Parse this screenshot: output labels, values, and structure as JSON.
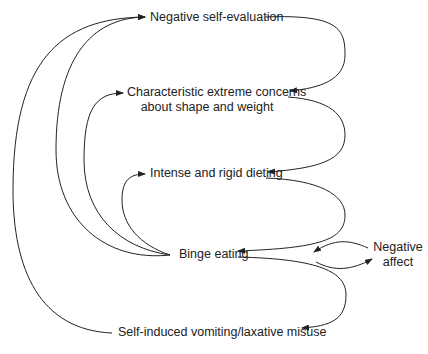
{
  "diagram": {
    "type": "cognitive-behavioural model (flow diagram)",
    "nodes": {
      "negative_self_evaluation": "Negative self-evaluation",
      "concerns_line1": "Characteristic extreme concerns",
      "concerns_line2": "about shape and weight",
      "dieting": "Intense and rigid dieting",
      "binge_eating": "Binge eating",
      "negative_affect_line1": "Negative",
      "negative_affect_line2": "affect",
      "compensatory": "Self-induced vomiting/laxative misuse"
    },
    "edges": [
      {
        "from": "Negative self-evaluation",
        "to": "Characteristic extreme concerns about shape and weight"
      },
      {
        "from": "Characteristic extreme concerns about shape and weight",
        "to": "Intense and rigid dieting"
      },
      {
        "from": "Intense and rigid dieting",
        "to": "Binge eating"
      },
      {
        "from": "Binge eating",
        "to": "Self-induced vomiting/laxative misuse"
      },
      {
        "from": "Binge eating",
        "to": "Negative affect"
      },
      {
        "from": "Negative affect",
        "to": "Binge eating"
      },
      {
        "from": "Binge eating",
        "to": "Intense and rigid dieting"
      },
      {
        "from": "Binge eating",
        "to": "Characteristic extreme concerns about shape and weight"
      },
      {
        "from": "Binge eating",
        "to": "Negative self-evaluation"
      },
      {
        "from": "Self-induced vomiting/laxative misuse",
        "to": "Negative self-evaluation"
      }
    ],
    "line_color": "#222222"
  }
}
